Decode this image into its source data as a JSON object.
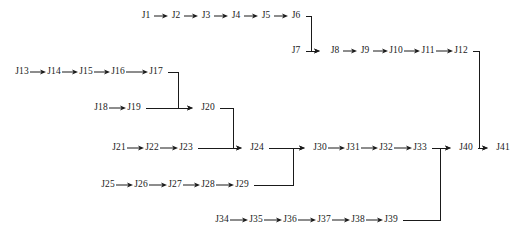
{
  "diagram": {
    "type": "flowchart",
    "width": 517,
    "height": 238,
    "background_color": "#ffffff",
    "line_color": "#1a1a1a",
    "text_color": "#1a1a1a",
    "nodes": [
      {
        "id": "J1",
        "label": "J1",
        "x": 146,
        "y": 16
      },
      {
        "id": "J2",
        "label": "J2",
        "x": 176,
        "y": 16
      },
      {
        "id": "J3",
        "label": "J3",
        "x": 206,
        "y": 16
      },
      {
        "id": "J4",
        "label": "J4",
        "x": 236,
        "y": 16
      },
      {
        "id": "J5",
        "label": "J5",
        "x": 266,
        "y": 16
      },
      {
        "id": "J6",
        "label": "J6",
        "x": 296,
        "y": 16
      },
      {
        "id": "J7",
        "label": "J7",
        "x": 296,
        "y": 51
      },
      {
        "id": "J8",
        "label": "J8",
        "x": 335,
        "y": 51
      },
      {
        "id": "J9",
        "label": "J9",
        "x": 365,
        "y": 51
      },
      {
        "id": "J10",
        "label": "J10",
        "x": 396,
        "y": 51
      },
      {
        "id": "J11",
        "label": "J11",
        "x": 428,
        "y": 51
      },
      {
        "id": "J12",
        "label": "J12",
        "x": 461,
        "y": 51
      },
      {
        "id": "J13",
        "label": "J13",
        "x": 22,
        "y": 72
      },
      {
        "id": "J14",
        "label": "J14",
        "x": 54,
        "y": 72
      },
      {
        "id": "J15",
        "label": "J15",
        "x": 86,
        "y": 72
      },
      {
        "id": "J16",
        "label": "J16",
        "x": 118,
        "y": 72
      },
      {
        "id": "J17",
        "label": "J17",
        "x": 156,
        "y": 72
      },
      {
        "id": "J18",
        "label": "J18",
        "x": 101,
        "y": 108
      },
      {
        "id": "J19",
        "label": "J19",
        "x": 134,
        "y": 108
      },
      {
        "id": "J20",
        "label": "J20",
        "x": 208,
        "y": 108
      },
      {
        "id": "J21",
        "label": "J21",
        "x": 119,
        "y": 148
      },
      {
        "id": "J22",
        "label": "J22",
        "x": 152,
        "y": 148
      },
      {
        "id": "J23",
        "label": "J23",
        "x": 186,
        "y": 148
      },
      {
        "id": "J24",
        "label": "J24",
        "x": 257,
        "y": 148
      },
      {
        "id": "J25",
        "label": "J25",
        "x": 108,
        "y": 185
      },
      {
        "id": "J26",
        "label": "J26",
        "x": 141,
        "y": 185
      },
      {
        "id": "J27",
        "label": "J27",
        "x": 175,
        "y": 185
      },
      {
        "id": "J28",
        "label": "J28",
        "x": 208,
        "y": 185
      },
      {
        "id": "J29",
        "label": "J29",
        "x": 242,
        "y": 185
      },
      {
        "id": "J30",
        "label": "J30",
        "x": 320,
        "y": 148
      },
      {
        "id": "J31",
        "label": "J31",
        "x": 353,
        "y": 148
      },
      {
        "id": "J32",
        "label": "J32",
        "x": 386,
        "y": 148
      },
      {
        "id": "J33",
        "label": "J33",
        "x": 420,
        "y": 148
      },
      {
        "id": "J34",
        "label": "J34",
        "x": 222,
        "y": 220
      },
      {
        "id": "J35",
        "label": "J35",
        "x": 256,
        "y": 220
      },
      {
        "id": "J36",
        "label": "J36",
        "x": 290,
        "y": 220
      },
      {
        "id": "J37",
        "label": "J37",
        "x": 324,
        "y": 220
      },
      {
        "id": "J38",
        "label": "J38",
        "x": 358,
        "y": 220
      },
      {
        "id": "J39",
        "label": "J39",
        "x": 391,
        "y": 220
      },
      {
        "id": "J40",
        "label": "J40",
        "x": 466,
        "y": 148
      },
      {
        "id": "J41",
        "label": "J41",
        "x": 503,
        "y": 148
      }
    ],
    "edges": [
      {
        "from": "J1",
        "to": "J2",
        "kind": "straight"
      },
      {
        "from": "J2",
        "to": "J3",
        "kind": "straight"
      },
      {
        "from": "J3",
        "to": "J4",
        "kind": "straight"
      },
      {
        "from": "J4",
        "to": "J5",
        "kind": "straight"
      },
      {
        "from": "J5",
        "to": "J6",
        "kind": "straight"
      },
      {
        "from": "J6",
        "to": "J8",
        "kind": "elbow-down"
      },
      {
        "from": "J7",
        "to": "J8",
        "kind": "straight"
      },
      {
        "from": "J8",
        "to": "J9",
        "kind": "straight"
      },
      {
        "from": "J9",
        "to": "J10",
        "kind": "straight"
      },
      {
        "from": "J10",
        "to": "J11",
        "kind": "straight"
      },
      {
        "from": "J11",
        "to": "J12",
        "kind": "straight"
      },
      {
        "from": "J12",
        "to": "J41",
        "kind": "elbow-down"
      },
      {
        "from": "J13",
        "to": "J14",
        "kind": "straight"
      },
      {
        "from": "J14",
        "to": "J15",
        "kind": "straight"
      },
      {
        "from": "J15",
        "to": "J16",
        "kind": "straight"
      },
      {
        "from": "J16",
        "to": "J17",
        "kind": "straight"
      },
      {
        "from": "J17",
        "to": "J20",
        "kind": "elbow-down"
      },
      {
        "from": "J18",
        "to": "J19",
        "kind": "straight"
      },
      {
        "from": "J19",
        "to": "J20",
        "kind": "straight"
      },
      {
        "from": "J20",
        "to": "J24",
        "kind": "elbow-down"
      },
      {
        "from": "J21",
        "to": "J22",
        "kind": "straight"
      },
      {
        "from": "J22",
        "to": "J23",
        "kind": "straight"
      },
      {
        "from": "J23",
        "to": "J24",
        "kind": "straight"
      },
      {
        "from": "J24",
        "to": "J30",
        "kind": "straight"
      },
      {
        "from": "J25",
        "to": "J26",
        "kind": "straight"
      },
      {
        "from": "J26",
        "to": "J27",
        "kind": "straight"
      },
      {
        "from": "J27",
        "to": "J28",
        "kind": "straight"
      },
      {
        "from": "J28",
        "to": "J29",
        "kind": "straight"
      },
      {
        "from": "J29",
        "to": "J30",
        "kind": "elbow-up"
      },
      {
        "from": "J30",
        "to": "J31",
        "kind": "straight"
      },
      {
        "from": "J31",
        "to": "J32",
        "kind": "straight"
      },
      {
        "from": "J32",
        "to": "J33",
        "kind": "straight"
      },
      {
        "from": "J33",
        "to": "J40",
        "kind": "straight"
      },
      {
        "from": "J34",
        "to": "J35",
        "kind": "straight"
      },
      {
        "from": "J35",
        "to": "J36",
        "kind": "straight"
      },
      {
        "from": "J36",
        "to": "J37",
        "kind": "straight"
      },
      {
        "from": "J37",
        "to": "J38",
        "kind": "straight"
      },
      {
        "from": "J38",
        "to": "J39",
        "kind": "straight"
      },
      {
        "from": "J39",
        "to": "J40",
        "kind": "elbow-up"
      },
      {
        "from": "J40",
        "to": "J41",
        "kind": "straight"
      }
    ],
    "connectors": [
      {
        "name": "j6-to-j7-row",
        "path": "M 306 16 L 311 16 L 311 51 L 320 51",
        "arrow_at": [
          320,
          51
        ]
      },
      {
        "name": "j7-to-j8",
        "path": "M 306 51 L 320 51",
        "arrow_at": [
          320,
          51
        ]
      },
      {
        "name": "j12-to-j41-row",
        "path": "M 473 51 L 479 51 L 479 148 L 488 148",
        "arrow_at": [
          488,
          148
        ]
      },
      {
        "name": "j17-to-j20-row",
        "path": "M 168 72 L 178 72 L 178 108 L 193 108",
        "arrow_at": [
          193,
          108
        ]
      },
      {
        "name": "j19-to-j20",
        "path": "M 146 108 L 193 108",
        "arrow_at": [
          193,
          108
        ]
      },
      {
        "name": "j20-to-j24-row",
        "path": "M 220 108 L 233 108 L 233 148 L 242 148",
        "arrow_at": [
          242,
          148
        ]
      },
      {
        "name": "j23-to-j24",
        "path": "M 198 148 L 242 148",
        "arrow_at": [
          242,
          148
        ]
      },
      {
        "name": "j24-to-j30",
        "path": "M 269 148 L 305 148",
        "arrow_at": [
          305,
          148
        ]
      },
      {
        "name": "j29-to-j30-row",
        "path": "M 254 185 L 293 185 L 293 148 L 305 148",
        "arrow_at": [
          305,
          148
        ]
      },
      {
        "name": "j33-to-j40",
        "path": "M 432 148 L 451 148",
        "arrow_at": [
          451,
          148
        ]
      },
      {
        "name": "j39-to-j40-row",
        "path": "M 403 220 L 440 220 L 440 148 L 451 148",
        "arrow_at": [
          451,
          148
        ]
      },
      {
        "name": "j40-to-j41",
        "path": "M 478 148 L 488 148",
        "arrow_at": [
          488,
          148
        ]
      }
    ]
  }
}
